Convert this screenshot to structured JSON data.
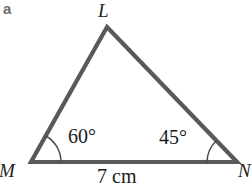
{
  "figure": {
    "part_label": "a",
    "background_color": "#ffffff",
    "stroke_color": "#595959",
    "arc_color": "#4d4d4d",
    "text_color": "#1b1b1b",
    "part_label_color": "#6e6e6e",
    "shape": "triangle",
    "vertices": [
      {
        "name": "L",
        "label": "L",
        "x": 107,
        "y": 27,
        "role": "apex"
      },
      {
        "name": "M",
        "label": "M",
        "x": 31,
        "y": 162,
        "role": "bottom-left"
      },
      {
        "name": "N",
        "label": "N",
        "x": 237,
        "y": 162,
        "role": "bottom-right"
      }
    ],
    "angles": [
      {
        "at_vertex": "M",
        "label": "60°",
        "value": 60,
        "unit": "degrees",
        "arc_radius": 30
      },
      {
        "at_vertex": "N",
        "label": "45°",
        "value": 45,
        "unit": "degrees",
        "arc_radius": 30
      }
    ],
    "sides": [
      {
        "from": "M",
        "to": "N",
        "label": "7 cm",
        "value": 7,
        "unit": "cm"
      }
    ]
  }
}
